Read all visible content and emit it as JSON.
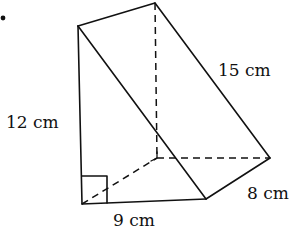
{
  "diagram": {
    "type": "triangular-prism",
    "bullet": "•",
    "labels": {
      "height": "12 cm",
      "hypotenuse": "15 cm",
      "base": "9 cm",
      "depth": "8 cm"
    },
    "right_angle_marker": true,
    "colors": {
      "stroke": "#111111",
      "background": "#ffffff"
    }
  }
}
